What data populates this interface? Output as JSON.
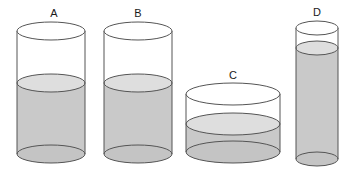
{
  "figure": {
    "title": "",
    "background_color": "#ffffff",
    "width": 351,
    "height": 179,
    "stroke_color": "#555555",
    "stroke_width": 1,
    "liquid_body_color": "#c9c9c9",
    "liquid_surface_color": "#dedede",
    "base_ellipse_color": "#c4c4c4",
    "empty_body_color": "#ffffff",
    "label_color": "#1a1a1a"
  },
  "chart_data": {
    "type": "diagram",
    "units": "pixels",
    "cylinders": [
      {
        "label": "A",
        "label_x": 54,
        "label_y": 17,
        "center_x": 51,
        "radius_x": 34,
        "radius_y": 9,
        "top_y": 31,
        "bottom_y": 154,
        "liquid_top_y": 83,
        "total_height_px": 123,
        "liquid_height_px": 71,
        "fill_fraction": 0.58,
        "diameter_px": 68
      },
      {
        "label": "B",
        "label_x": 138,
        "label_y": 17,
        "center_x": 138,
        "radius_x": 34,
        "radius_y": 9,
        "top_y": 31,
        "bottom_y": 154,
        "liquid_top_y": 83,
        "total_height_px": 123,
        "liquid_height_px": 71,
        "fill_fraction": 0.58,
        "diameter_px": 68
      },
      {
        "label": "C",
        "label_x": 233,
        "label_y": 79,
        "center_x": 233,
        "radius_x": 47,
        "radius_y": 11,
        "top_y": 94,
        "bottom_y": 152,
        "liquid_top_y": 124,
        "total_height_px": 58,
        "liquid_height_px": 28,
        "fill_fraction": 0.48,
        "diameter_px": 94
      },
      {
        "label": "D",
        "label_x": 317,
        "label_y": 16,
        "center_x": 317,
        "radius_x": 21,
        "radius_y": 7,
        "top_y": 28,
        "bottom_y": 159,
        "liquid_top_y": 48,
        "total_height_px": 131,
        "liquid_height_px": 111,
        "fill_fraction": 0.85,
        "diameter_px": 42
      }
    ]
  }
}
